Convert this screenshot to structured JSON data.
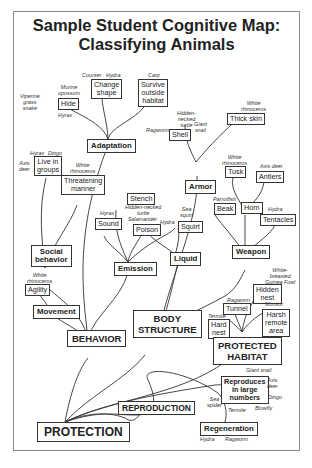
{
  "title": {
    "line1": "Sample Student Cognitive Map:",
    "line2": "Classifying Animals"
  },
  "nodes": {
    "protection": "PROTECTION",
    "behavior": "BEHAVIOR",
    "body_structure_1": "BODY",
    "body_structure_2": "STRUCTURE",
    "protected_habitat_1": "PROTECTED",
    "protected_habitat_2": "HABITAT",
    "reproduction": "REPRODUCTION",
    "adaptation": "Adaptation",
    "social_behavior_1": "Social",
    "social_behavior_2": "behavior",
    "movement": "Movement",
    "emission": "Emission",
    "liquid": "Liquid",
    "armor": "Armor",
    "weapon": "Weapon",
    "regeneration": "Regeneration",
    "reproduces_1": "Reproduces",
    "reproduces_2": "in large",
    "reproduces_3": "numbers",
    "hide": "Hide",
    "change_shape_1": "Change",
    "change_shape_2": "shape",
    "survive_1": "Survive",
    "survive_2": "outside",
    "survive_3": "habitat",
    "live_groups_1": "Live in",
    "live_groups_2": "groups",
    "threatening_1": "Threatening",
    "threatening_2": "manner",
    "agility": "Agility",
    "sound": "Sound",
    "stench": "Stench",
    "poison": "Poison",
    "squirt": "Squirt",
    "shell": "Shell",
    "thick_skin": "Thick skin",
    "tusk": "Tusk",
    "antlers": "Antlers",
    "beak": "Beak",
    "horn": "Horn",
    "tentacles": "Tentacles",
    "hidden_nest_1": "Hidden",
    "hidden_nest_2": "nest",
    "tunnel": "Tunnel",
    "hard_nest_1": "Hard",
    "hard_nest_2": "nest",
    "harsh_1": "Harsh",
    "harsh_2": "remote",
    "harsh_3": "area"
  },
  "examples": {
    "viperine": [
      "Viperine",
      "grass",
      "snake"
    ],
    "murine": [
      "Murine",
      "opossum"
    ],
    "hyrax_hide": "Hyrax",
    "courser": "Courser",
    "hydra_shape": "Hydra",
    "carp": "Carp",
    "hyrax_groups": "Hyrax",
    "dingo_groups": "Dingo",
    "axis_deer_groups": [
      "Axis",
      "deer"
    ],
    "white_rhino_threat": [
      "White",
      "rhinoceros"
    ],
    "white_rhino_agility": [
      "White",
      "rhinoceros"
    ],
    "hidden_turtle_stench": [
      "Hidden-necked",
      "turtle"
    ],
    "hyrax_sound": "Hyrax",
    "salamander": "Salamander",
    "hydra_poison": "Hydra",
    "sea_squirt": [
      "Sea",
      "squirt"
    ],
    "hidden_turtle_shell": [
      "Hidden-",
      "necked",
      "turtle"
    ],
    "ragworm_shell": "Ragworm",
    "giant_snail_shell": [
      "Giant",
      "snail"
    ],
    "white_rhino_skin": [
      "White",
      "rhinoceros"
    ],
    "white_rhino_tusk": [
      "White",
      "rhinoceros"
    ],
    "axis_deer_antlers": "Axis deer",
    "parrotfish": "Parrotfish",
    "hydra_tentacles": "Hydra",
    "guinea_fowl": [
      "White-",
      "breasted",
      "Guinea Fowl"
    ],
    "ragworm_tunnel": "Ragworm",
    "termite_nest": "Termite",
    "monitor": "Monitor",
    "giant_snail_repro": "Giant snail",
    "axis_deer_repro": [
      "Axis",
      "deer"
    ],
    "dingo_repro": "Dingo",
    "sea_spider": [
      "Sea",
      "spider"
    ],
    "termite_repro": "Termite",
    "blowfly": "Blowfly",
    "hydra_regen": "Hydra",
    "ragworm_regen": "Ragworm"
  }
}
